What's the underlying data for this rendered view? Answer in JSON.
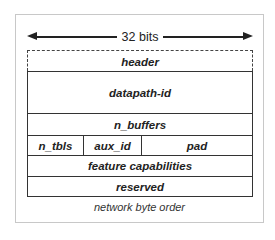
{
  "diagram": {
    "width_label": "32 bits",
    "fields": {
      "header": "header",
      "datapath_id": "datapath-id",
      "n_buffers": "n_buffers",
      "n_tbls": "n_tbls",
      "aux_id": "aux_id",
      "pad": "pad",
      "feature_capabilities": "feature capabilities",
      "reserved": "reserved"
    },
    "footer": "network byte order"
  }
}
